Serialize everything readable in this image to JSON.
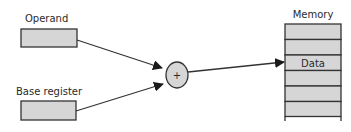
{
  "diagram": {
    "operand": {
      "label": "Operand"
    },
    "base_register": {
      "label": "Base register"
    },
    "adder": {
      "symbol": "+"
    },
    "memory": {
      "label": "Memory",
      "cells": [
        "",
        "",
        "Data",
        "",
        "",
        ""
      ],
      "highlight_label": "Data"
    },
    "colors": {
      "fill": "#d6d6d6",
      "stroke": "#333333",
      "text": "#2a2a2a"
    }
  }
}
